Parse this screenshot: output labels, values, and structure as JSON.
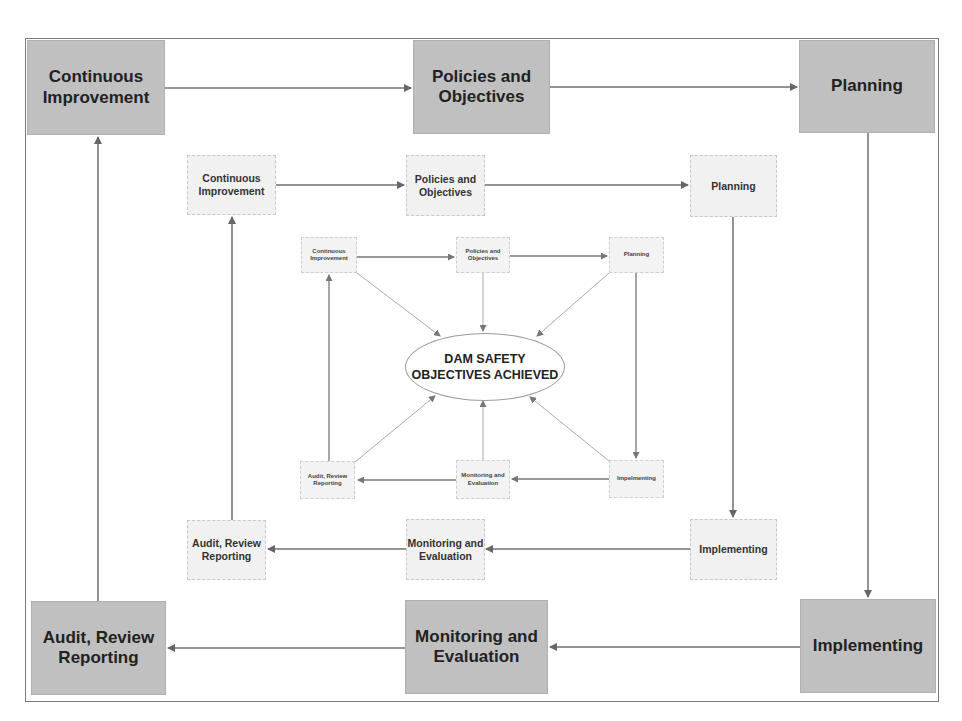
{
  "diagram": {
    "center": {
      "label": "DAM SAFETY\nOBJECTIVES ACHIEVED"
    },
    "outer_cycle": [
      {
        "id": "ci",
        "label": "Continuous\nImprovement"
      },
      {
        "id": "po",
        "label": "Policies and\nObjectives"
      },
      {
        "id": "plan",
        "label": "Planning"
      },
      {
        "id": "impl",
        "label": "Implementing"
      },
      {
        "id": "me",
        "label": "Monitoring and\nEvaluation"
      },
      {
        "id": "audit",
        "label": "Audit, Review\nReporting"
      }
    ],
    "middle_cycle": [
      {
        "id": "ci",
        "label": "Continuous\nImprovement"
      },
      {
        "id": "po",
        "label": "Policies and\nObjectives"
      },
      {
        "id": "plan",
        "label": "Planning"
      },
      {
        "id": "impl",
        "label": "Implementing"
      },
      {
        "id": "me",
        "label": "Monitoring and\nEvaluation"
      },
      {
        "id": "audit",
        "label": "Audit, Review\nReporting"
      }
    ],
    "inner_cycle": [
      {
        "id": "ci",
        "label": "Continuous\nImprovement"
      },
      {
        "id": "po",
        "label": "Policies and\nObjectives"
      },
      {
        "id": "plan",
        "label": "Planning"
      },
      {
        "id": "impl",
        "label": "Impelmenting"
      },
      {
        "id": "me",
        "label": "Monitoring and\nEvaluation"
      },
      {
        "id": "audit",
        "label": "Audit, Review\nReporting"
      }
    ],
    "flow": [
      "Continuous Improvement",
      "Policies and Objectives",
      "Planning",
      "Implementing",
      "Monitoring and Evaluation",
      "Audit, Review Reporting",
      "Continuous Improvement"
    ],
    "colors": {
      "outer_box": "#c0c0c0",
      "middle_box": "#f1f1f1",
      "inner_box": "#f3f3f3",
      "arrow": "#6e6e6e",
      "frame": "#7a7a7a"
    }
  }
}
